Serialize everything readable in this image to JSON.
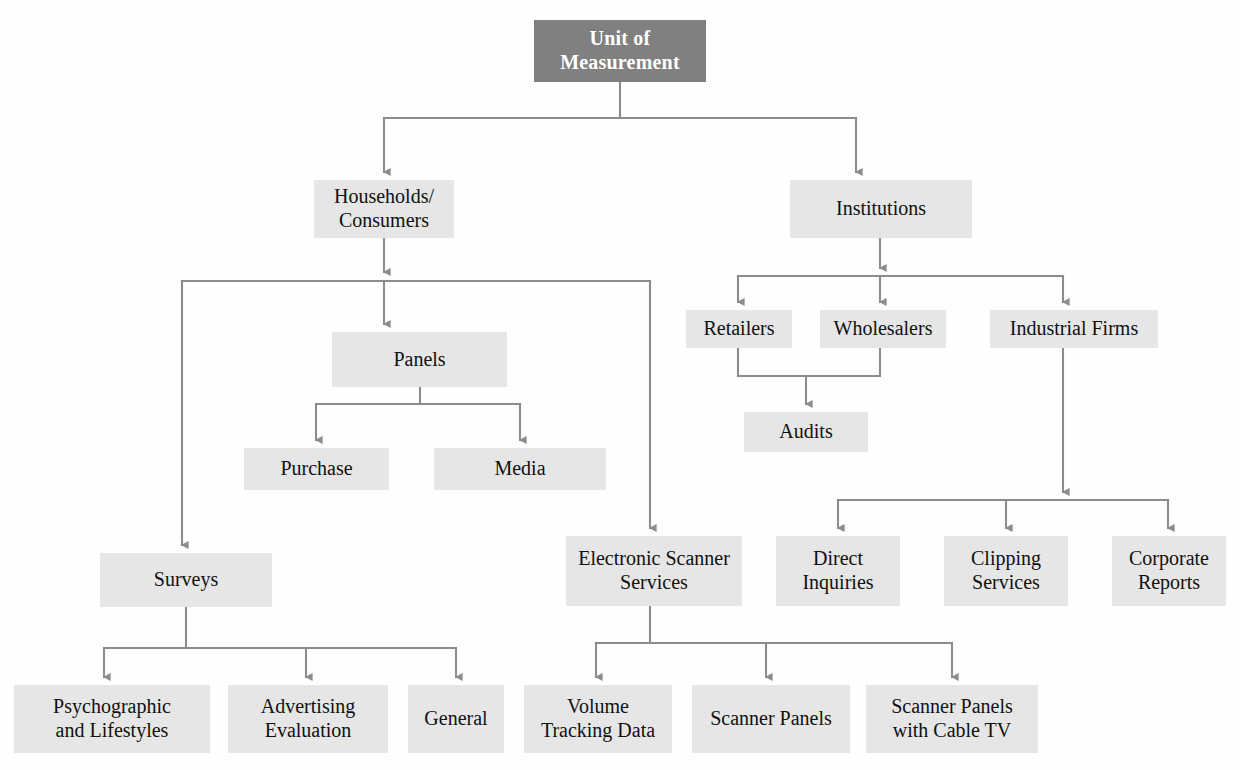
{
  "diagram": {
    "type": "hierarchy-tree",
    "colors": {
      "root_fill": "#808080",
      "root_text": "#ffffff",
      "node_fill": "#e6e6e6",
      "node_text": "#111111",
      "connector": "#8c8c8c",
      "page_background": "#ffffff"
    },
    "nodes": [
      {
        "id": "root",
        "label": "Unit of\nMeasurement",
        "level": 0,
        "x": 534,
        "y": 20,
        "w": 172,
        "h": 62,
        "style": "root"
      },
      {
        "id": "households",
        "label": "Households/\nConsumers",
        "level": 1,
        "x": 314,
        "y": 180,
        "w": 140,
        "h": 58,
        "style": "node"
      },
      {
        "id": "institutions",
        "label": "Institutions",
        "level": 1,
        "x": 790,
        "y": 180,
        "w": 182,
        "h": 58,
        "style": "node"
      },
      {
        "id": "panels",
        "label": "Panels",
        "level": 2,
        "x": 332,
        "y": 332,
        "w": 175,
        "h": 55,
        "style": "node"
      },
      {
        "id": "retailers",
        "label": "Retailers",
        "level": 2,
        "x": 686,
        "y": 310,
        "w": 106,
        "h": 38,
        "style": "node"
      },
      {
        "id": "wholesalers",
        "label": "Wholesalers",
        "level": 2,
        "x": 820,
        "y": 310,
        "w": 126,
        "h": 38,
        "style": "node"
      },
      {
        "id": "industrial",
        "label": "Industrial Firms",
        "level": 2,
        "x": 990,
        "y": 310,
        "w": 168,
        "h": 38,
        "style": "node"
      },
      {
        "id": "purchase",
        "label": "Purchase",
        "level": 3,
        "x": 244,
        "y": 448,
        "w": 145,
        "h": 42,
        "style": "node"
      },
      {
        "id": "media",
        "label": "Media",
        "level": 3,
        "x": 434,
        "y": 448,
        "w": 172,
        "h": 42,
        "style": "node"
      },
      {
        "id": "audits",
        "label": "Audits",
        "level": 3,
        "x": 744,
        "y": 412,
        "w": 124,
        "h": 40,
        "style": "node"
      },
      {
        "id": "surveys",
        "label": "Surveys",
        "level": 3,
        "x": 100,
        "y": 553,
        "w": 172,
        "h": 54,
        "style": "node"
      },
      {
        "id": "scanner",
        "label": "Electronic Scanner\nServices",
        "level": 3,
        "x": 566,
        "y": 536,
        "w": 176,
        "h": 70,
        "style": "node"
      },
      {
        "id": "direct",
        "label": "Direct\nInquiries",
        "level": 3,
        "x": 776,
        "y": 536,
        "w": 124,
        "h": 70,
        "style": "node"
      },
      {
        "id": "clipping",
        "label": "Clipping\nServices",
        "level": 3,
        "x": 944,
        "y": 536,
        "w": 124,
        "h": 70,
        "style": "node"
      },
      {
        "id": "corporate",
        "label": "Corporate\nReports",
        "level": 3,
        "x": 1112,
        "y": 536,
        "w": 114,
        "h": 70,
        "style": "node"
      },
      {
        "id": "psycho",
        "label": "Psychographic\nand Lifestyles",
        "level": 4,
        "x": 14,
        "y": 685,
        "w": 196,
        "h": 68,
        "style": "node"
      },
      {
        "id": "advertising",
        "label": "Advertising\nEvaluation",
        "level": 4,
        "x": 228,
        "y": 685,
        "w": 160,
        "h": 68,
        "style": "node"
      },
      {
        "id": "general",
        "label": "General",
        "level": 4,
        "x": 408,
        "y": 685,
        "w": 96,
        "h": 68,
        "style": "node"
      },
      {
        "id": "volume",
        "label": "Volume\nTracking Data",
        "level": 4,
        "x": 524,
        "y": 685,
        "w": 148,
        "h": 68,
        "style": "node"
      },
      {
        "id": "scpanels",
        "label": "Scanner Panels",
        "level": 4,
        "x": 692,
        "y": 685,
        "w": 158,
        "h": 68,
        "style": "node"
      },
      {
        "id": "sccable",
        "label": "Scanner Panels\nwith Cable TV",
        "level": 4,
        "x": 866,
        "y": 685,
        "w": 172,
        "h": 68,
        "style": "node"
      }
    ],
    "edges": [
      {
        "from": "root",
        "to": "households"
      },
      {
        "from": "root",
        "to": "institutions"
      },
      {
        "from": "households",
        "to": "panels"
      },
      {
        "from": "households",
        "to": "surveys"
      },
      {
        "from": "households",
        "to": "scanner"
      },
      {
        "from": "institutions",
        "to": "retailers"
      },
      {
        "from": "institutions",
        "to": "wholesalers"
      },
      {
        "from": "institutions",
        "to": "industrial"
      },
      {
        "from": "panels",
        "to": "purchase"
      },
      {
        "from": "panels",
        "to": "media"
      },
      {
        "from": "retailers",
        "to": "audits"
      },
      {
        "from": "wholesalers",
        "to": "audits"
      },
      {
        "from": "industrial",
        "to": "direct"
      },
      {
        "from": "industrial",
        "to": "clipping"
      },
      {
        "from": "industrial",
        "to": "corporate"
      },
      {
        "from": "surveys",
        "to": "psycho"
      },
      {
        "from": "surveys",
        "to": "advertising"
      },
      {
        "from": "surveys",
        "to": "general"
      },
      {
        "from": "scanner",
        "to": "volume"
      },
      {
        "from": "scanner",
        "to": "scpanels"
      },
      {
        "from": "scanner",
        "to": "sccable"
      }
    ]
  }
}
